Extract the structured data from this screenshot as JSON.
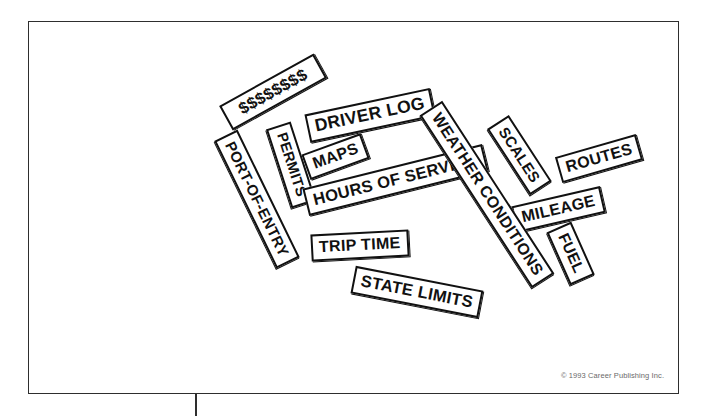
{
  "figure": {
    "credit": "© 1993 Career Publishing Inc.",
    "frame_color": "#2e2e2e",
    "sign_border_color": "#111111",
    "sign_fill_color": "#ffffff",
    "map_stroke_color": "#3b3b3b"
  },
  "map": {
    "regions": [
      {
        "name": "contiguous-united-states"
      },
      {
        "name": "alaska"
      },
      {
        "name": "hawaii"
      }
    ]
  },
  "signs": [
    {
      "id": "money",
      "label": "$$$$$$$$",
      "size": 16.5,
      "rotate": -29,
      "x": 219,
      "y": 78,
      "w": 104,
      "h": 26
    },
    {
      "id": "driver-log",
      "label": "DRIVER LOG",
      "size": 17.5,
      "rotate": -12,
      "x": 306,
      "y": 101,
      "w": 112,
      "h": 28
    },
    {
      "id": "maps",
      "label": "MAPS",
      "size": 16.0,
      "rotate": -20,
      "x": 304,
      "y": 143,
      "w": 56,
      "h": 26
    },
    {
      "id": "permits",
      "label": "PERMITS",
      "size": 14.5,
      "rotate": 72,
      "x": 250,
      "y": 152,
      "w": 74,
      "h": 23
    },
    {
      "id": "hours-of-service",
      "label": "HOURS OF SERVICE",
      "size": 16.5,
      "rotate": -14,
      "x": 303,
      "y": 166,
      "w": 169,
      "h": 27
    },
    {
      "id": "scales",
      "label": "SCALES",
      "size": 15.0,
      "rotate": 57,
      "x": 480,
      "y": 142,
      "w": 67,
      "h": 24
    },
    {
      "id": "routes",
      "label": "ROUTES",
      "size": 16.0,
      "rotate": -16,
      "x": 557,
      "y": 145,
      "w": 73,
      "h": 26
    },
    {
      "id": "port-of-entry",
      "label": "PORT-OF-ENTRY",
      "size": 15.0,
      "rotate": 64,
      "x": 186,
      "y": 186,
      "w": 130,
      "h": 24
    },
    {
      "id": "mileage",
      "label": "MILEAGE",
      "size": 16.0,
      "rotate": -13,
      "x": 513,
      "y": 196,
      "w": 82,
      "h": 26
    },
    {
      "id": "weather-conditions",
      "label": "WEATHER CONDITIONS",
      "size": 16.0,
      "rotate": 57,
      "x": 384,
      "y": 181,
      "w": 191,
      "h": 26
    },
    {
      "id": "trip-time",
      "label": "TRIP TIME",
      "size": 16.0,
      "rotate": -3,
      "x": 311,
      "y": 232,
      "w": 90,
      "h": 26
    },
    {
      "id": "fuel",
      "label": "FUEL",
      "size": 15.5,
      "rotate": 66,
      "x": 542,
      "y": 240,
      "w": 50,
      "h": 25
    },
    {
      "id": "state-limits",
      "label": "STATE LIMITS",
      "size": 16.5,
      "rotate": 11,
      "x": 352,
      "y": 278,
      "w": 116,
      "h": 27
    }
  ]
}
